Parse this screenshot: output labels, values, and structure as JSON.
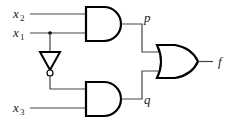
{
  "diagram": {
    "type": "logic-circuit",
    "inputs": [
      {
        "name": "x",
        "sub": "2"
      },
      {
        "name": "x",
        "sub": "1"
      },
      {
        "name": "x",
        "sub": "3"
      }
    ],
    "intermediate": {
      "p": "p",
      "q": "q"
    },
    "output": "f",
    "gates": [
      {
        "id": "and1",
        "type": "AND",
        "inputs": [
          "x2",
          "x1"
        ],
        "output": "p"
      },
      {
        "id": "not1",
        "type": "NOT",
        "inputs": [
          "x1"
        ],
        "output": "x1'"
      },
      {
        "id": "and2",
        "type": "AND",
        "inputs": [
          "x1'",
          "x3"
        ],
        "output": "q"
      },
      {
        "id": "or1",
        "type": "OR",
        "inputs": [
          "p",
          "q"
        ],
        "output": "f"
      }
    ]
  }
}
